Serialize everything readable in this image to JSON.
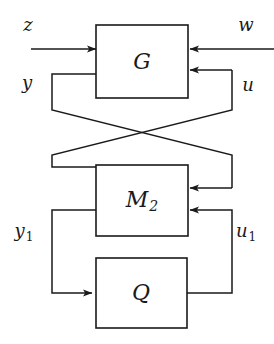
{
  "diagram": {
    "type": "control-block-diagram",
    "background_color": "#ffffff",
    "line_color": "#1a1a1a",
    "blocks": [
      {
        "id": "G",
        "label": "G",
        "subscript": "",
        "x": 96,
        "y": 25,
        "w": 92,
        "h": 73
      },
      {
        "id": "M2",
        "label": "M",
        "subscript": "2",
        "x": 96,
        "y": 165,
        "w": 92,
        "h": 71
      },
      {
        "id": "Q",
        "label": "Q",
        "subscript": "",
        "x": 96,
        "y": 258,
        "w": 91,
        "h": 70
      }
    ],
    "signals": [
      {
        "id": "z",
        "label": "z",
        "subscript": "",
        "x": 28,
        "y": 26,
        "direction": "out-left",
        "from": "G"
      },
      {
        "id": "w",
        "label": "w",
        "subscript": "",
        "x": 246,
        "y": 26,
        "direction": "in-right",
        "to": "G"
      },
      {
        "id": "y",
        "label": "y",
        "subscript": "",
        "x": 27,
        "y": 84,
        "direction": "out-left",
        "from": "G"
      },
      {
        "id": "u",
        "label": "u",
        "subscript": "",
        "x": 248,
        "y": 86,
        "direction": "in-right",
        "to": "G"
      },
      {
        "id": "y1",
        "label": "y",
        "subscript": "1",
        "x": 24,
        "y": 232,
        "direction": "out-left",
        "from": "M2"
      },
      {
        "id": "u1",
        "label": "u",
        "subscript": "1",
        "x": 246,
        "y": 232,
        "direction": "in-right",
        "to": "M2"
      }
    ]
  }
}
